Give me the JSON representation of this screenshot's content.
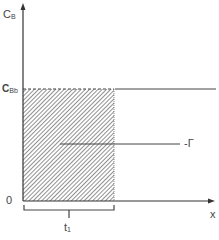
{
  "diagram": {
    "y_axis_label": "C",
    "y_axis_label_sub": "B",
    "level_label": "C",
    "level_label_sub": "Bb",
    "origin_label": "0",
    "x_axis_label": "x",
    "region_label": "-Γ",
    "brace_label": "t",
    "brace_label_sub": "1",
    "colors": {
      "axis": "#444444",
      "hatch": "#555555",
      "text": "#444444"
    }
  }
}
